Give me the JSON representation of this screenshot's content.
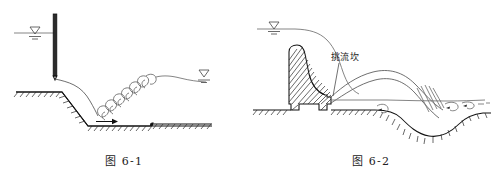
{
  "sheet": {
    "title": "水力学图 6-1 与图 6-2",
    "background_color": "#ffffff",
    "ink_color": "#111111",
    "width": 495,
    "height": 184
  },
  "figures": [
    {
      "id": "fig-6-1",
      "caption": "图 6-1",
      "description": "闸下出流底流消能水跃示意图",
      "elements": {
        "upstream_water_level_symbol": "water-level-triangle",
        "gate": "vertical-sluice-gate",
        "jet": "free-falling-nappe",
        "roller": "hydraulic-jump-roller",
        "flow_arrow": "downstream-flow-arrow",
        "downstream_water_level_symbol": "water-level-triangle",
        "ground": "hatched-excavated-channel"
      }
    },
    {
      "id": "fig-6-2",
      "caption": "图 6-2",
      "description": "挑流鼻坎挑射水流及下游冲刷坑示意图",
      "annotation": {
        "label": "挑流坎",
        "leader": "leader-line-to-bucket"
      },
      "elements": {
        "upstream_water_level_symbol": "water-level-triangle",
        "dam": "hatched-gravity-dam-body",
        "flip_bucket": "ski-jump-bucket",
        "jet": "ski-jump-trajectory-nappe",
        "scour_pit": "downstream-scour-hole",
        "eddies": "swirl-vortices",
        "ground": "hatched-riverbed"
      }
    }
  ],
  "annotations": {
    "flip_bucket_label": "挑流坎"
  },
  "captions": {
    "left": "图 6-1",
    "right": "图 6-2"
  }
}
